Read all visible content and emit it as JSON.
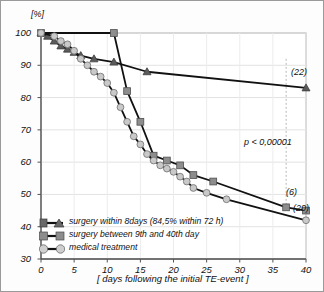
{
  "chart_data": {
    "type": "line",
    "title": "",
    "xlabel": "[ days following the initial TE-event ]",
    "ylabel": "[%]",
    "xlim": [
      0,
      40
    ],
    "ylim": [
      30,
      100
    ],
    "xticks": [
      0,
      5,
      10,
      15,
      20,
      25,
      30,
      35,
      40
    ],
    "yticks": [
      30,
      40,
      50,
      60,
      70,
      80,
      90,
      100
    ],
    "grid": true,
    "legend_position": "bottom-left",
    "annotations": [
      {
        "text": "p < 0,00001",
        "x": 33.5,
        "y": 64
      },
      {
        "text": "(22)",
        "x": 40,
        "y": 85
      },
      {
        "text": "(6)",
        "x": 38.5,
        "y": 48
      },
      {
        "text": "(20)",
        "x": 40,
        "y": 44
      }
    ],
    "series": [
      {
        "name": "surgery within 8days (84,5% within 72 h)",
        "marker": "triangle",
        "color": "#5a5a5a",
        "x": [
          0,
          1,
          2,
          3,
          4,
          5,
          6,
          8,
          11,
          16,
          40
        ],
        "y": [
          100,
          99,
          97.5,
          96,
          95,
          94,
          93,
          92,
          91,
          88,
          83
        ]
      },
      {
        "name": "surgery between 9th and 40th day",
        "marker": "square",
        "color": "#8d8d8d",
        "x": [
          0,
          11,
          13,
          15,
          17,
          19,
          21,
          23,
          26,
          37,
          40
        ],
        "y": [
          100,
          100,
          82,
          72.5,
          62,
          60.5,
          59,
          56,
          54,
          46,
          45
        ]
      },
      {
        "name": "medical treatment",
        "marker": "circle",
        "color": "#c9c9c9",
        "x": [
          0,
          2,
          3,
          4,
          5,
          6,
          7,
          8,
          9,
          10,
          11,
          12,
          13,
          14,
          15,
          16,
          17,
          18,
          19,
          20,
          21,
          22,
          23,
          25,
          28,
          40
        ],
        "y": [
          100,
          99,
          97.5,
          96.5,
          94.5,
          92,
          90,
          88,
          86.5,
          84.5,
          81.5,
          77,
          72.5,
          68,
          65.5,
          62.5,
          60.5,
          59,
          58,
          57,
          55.5,
          54,
          52,
          50.5,
          48.5,
          42
        ]
      }
    ]
  },
  "legend": {
    "items": [
      {
        "label": "surgery within 8days (84,5% within 72 h)",
        "marker": "triangle"
      },
      {
        "label": "surgery between 9th and 40th day",
        "marker": "square"
      },
      {
        "label": "medical treatment",
        "marker": "circle"
      }
    ]
  },
  "axes": {
    "y_unit": "[%]",
    "x_title": "[ days following the initial TE-event ]"
  }
}
